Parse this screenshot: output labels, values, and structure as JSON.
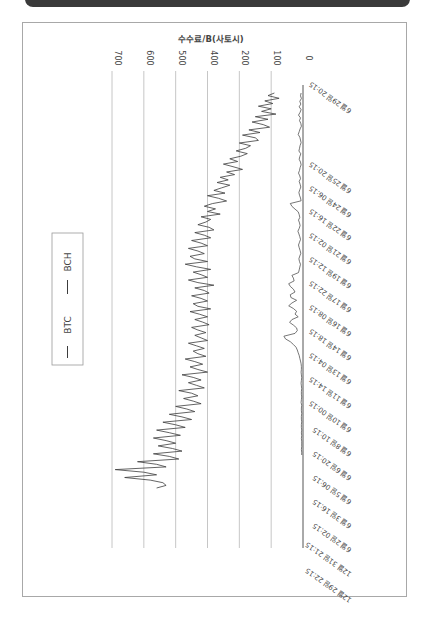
{
  "banner": {
    "text": ""
  },
  "chart_data": {
    "type": "line",
    "orientation": "rotated-90-clockwise",
    "title": "수수료/B(사토시)",
    "ylabel": "수수료/B(사토시)",
    "xlabel": "",
    "y_ticks": [
      {
        "label": "0",
        "value": 0
      },
      {
        "label": "100",
        "value": 100
      },
      {
        "label": "200",
        "value": 200
      },
      {
        "label": "400",
        "value": 300
      },
      {
        "label": "500",
        "value": 400
      },
      {
        "label": "600",
        "value": 500
      },
      {
        "label": "700",
        "value": 600
      }
    ],
    "ylim": [
      0,
      700
    ],
    "grid": true,
    "x_tick_labels": [
      "6월 29일 20:15",
      "6월 25일 20:15",
      "6월 24일 06:15",
      "6월 22일 16:15",
      "6월 21일 02:15",
      "6월 19일 12:15",
      "6월 17일 22:15",
      "6월 16일 08:15",
      "6월 14일 18:15",
      "6월 13일 04:15",
      "6월 11일 14:15",
      "6월 10일 00:15",
      "6월 8일 10:15",
      "6월 6일 20:15",
      "6월 5일 06:15",
      "6월 3일 16:15",
      "6월 2일 02:15",
      "12월 31일 21:15",
      "12월 29일 22:15"
    ],
    "legend": {
      "position": "left",
      "entries": [
        "BTC",
        "BCH"
      ]
    },
    "series": [
      {
        "name": "BTC",
        "values": [
          90,
          110,
          75,
          120,
          95,
          140,
          100,
          130,
          85,
          150,
          110,
          160,
          125,
          105,
          170,
          135,
          190,
          150,
          140,
          200,
          165,
          180,
          210,
          175,
          195,
          230,
          205,
          250,
          220,
          190,
          240,
          215,
          260,
          235,
          270,
          230,
          255,
          280,
          245,
          300,
          265,
          240,
          285,
          310,
          275,
          300,
          260,
          320,
          290,
          305,
          330,
          295,
          280,
          340,
          310,
          290,
          350,
          320,
          300,
          360,
          330,
          310,
          355,
          340,
          300,
          370,
          335,
          290,
          345,
          320,
          300,
          360,
          330,
          280,
          340,
          310,
          295,
          350,
          320,
          300,
          345,
          330,
          290,
          355,
          325,
          300,
          340,
          315,
          295,
          350,
          330,
          305,
          340,
          320,
          300,
          360,
          335,
          310,
          345,
          330,
          305,
          370,
          340,
          315,
          355,
          330,
          300,
          380,
          345,
          320,
          360,
          335,
          310,
          390,
          350,
          330,
          375,
          345,
          320,
          400,
          365,
          340,
          420,
          380,
          350,
          440,
          400,
          370,
          460,
          420,
          385,
          470,
          430,
          400,
          455,
          410,
          380,
          470,
          420,
          390,
          520,
          460,
          430,
          590,
          500,
          460,
          560,
          480,
          440,
          430,
          460
        ]
      },
      {
        "name": "BCH",
        "values": [
          6,
          8,
          5,
          10,
          7,
          12,
          6,
          9,
          14,
          8,
          11,
          7,
          5,
          9,
          12,
          15,
          10,
          8,
          6,
          9,
          11,
          13,
          7,
          10,
          12,
          8,
          6,
          9,
          11,
          14,
          10,
          8,
          12,
          9,
          7,
          10,
          13,
          11,
          8,
          6,
          40,
          35,
          25,
          15,
          12,
          10,
          14,
          11,
          9,
          12,
          16,
          13,
          10,
          8,
          11,
          14,
          12,
          9,
          7,
          10,
          13,
          11,
          8,
          10,
          12,
          14,
          35,
          30,
          28,
          45,
          40,
          30,
          25,
          40,
          38,
          20,
          35,
          45,
          30,
          20,
          25,
          15,
          35,
          42,
          30,
          20,
          18,
          25,
          60,
          55,
          40,
          30,
          22,
          18,
          15,
          12,
          10,
          8,
          6,
          5,
          5,
          6,
          5,
          4,
          5,
          6,
          5,
          4,
          5,
          5,
          4,
          5,
          6,
          4,
          5,
          5,
          4,
          5,
          5,
          4,
          5,
          5,
          4,
          5,
          4,
          5,
          4,
          4,
          4,
          5,
          4,
          4
        ]
      }
    ]
  },
  "colors": {
    "line": "#3c3c3c",
    "grid": "#b8b8b8",
    "frame": "#a8a8a8",
    "banner": "#3a3a3a",
    "text": "#444444"
  }
}
